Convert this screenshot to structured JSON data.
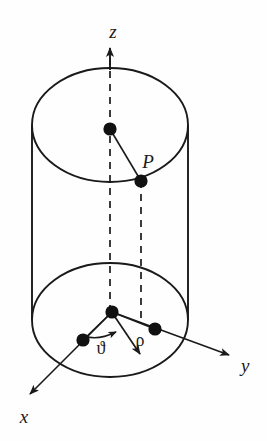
{
  "figure": {
    "name": "cylindrical-coordinates-diagram",
    "background_color": "#fefefe",
    "stroke_color": "#1a1a1a",
    "dot_color": "#111111"
  },
  "axes": {
    "z": {
      "label": "z",
      "label_x": 113,
      "label_y": 38,
      "direction": "up",
      "arrow_tip_x": 110,
      "arrow_tip_y": 44,
      "style": "dashed"
    },
    "x": {
      "label": "x",
      "label_x": 24,
      "label_y": 421,
      "direction": "down-left",
      "arrow_tip_x": 26,
      "arrow_tip_y": 398,
      "style": "solid"
    },
    "y": {
      "label": "y",
      "label_x": 243,
      "label_y": 371,
      "direction": "down-right",
      "arrow_tip_x": 234,
      "arrow_tip_y": 358,
      "style": "solid"
    }
  },
  "points": {
    "top_center": {
      "name": "top-center-point",
      "x": 110,
      "y": 129,
      "r": 6.5
    },
    "p": {
      "name": "point-p",
      "x": 141,
      "y": 181,
      "r": 6.5,
      "label": "P",
      "label_x": 146,
      "label_y": 166
    },
    "origin": {
      "name": "origin-point",
      "x": 112,
      "y": 312,
      "r": 6.5
    },
    "x_axis_dot": {
      "name": "x-axis-point",
      "x": 83,
      "y": 340,
      "r": 6.5
    },
    "y_axis_dot": {
      "name": "y-axis-point",
      "x": 155,
      "y": 329,
      "r": 6.5
    }
  },
  "parameters": {
    "rho": {
      "label": "ρ",
      "label_x": 141,
      "label_y": 345,
      "arrow_tip_x": 143,
      "arrow_tip_y": 358
    },
    "theta": {
      "label": "ϑ",
      "label_x": 101,
      "label_y": 352,
      "arc_arrow_tip_x": 122,
      "arc_arrow_tip_y": 333
    }
  },
  "cylinder": {
    "top_ellipse": {
      "cx": 110,
      "cy": 125,
      "rx": 78,
      "ry": 57
    },
    "bottom_ellipse": {
      "cx": 110,
      "cy": 320,
      "rx": 78,
      "ry": 57
    },
    "left_wall_x": 32,
    "right_wall_x": 188,
    "wall_top_y": 125,
    "wall_bottom_y": 320
  }
}
